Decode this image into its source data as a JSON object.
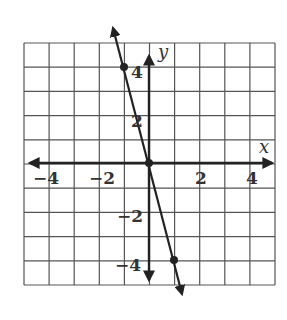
{
  "chart_data": {
    "type": "line",
    "title": "",
    "xlabel": "x",
    "ylabel": "y",
    "xlim": [
      -5,
      5
    ],
    "ylim": [
      -5,
      5
    ],
    "grid": true,
    "x_ticks": [
      "-4",
      "-2",
      "2",
      "4"
    ],
    "y_ticks": [
      "4",
      "2",
      "-2",
      "-4"
    ],
    "series": [
      {
        "name": "line",
        "equation": "y = -4x",
        "points": [
          [
            -1,
            4
          ],
          [
            0,
            0
          ],
          [
            1,
            -4
          ]
        ]
      }
    ],
    "colors": {
      "grid": "#555555",
      "axis": "#222222",
      "line": "#222222"
    }
  },
  "labels": {
    "x_axis": "x",
    "y_axis": "y",
    "x_tick_neg4": "−4",
    "x_tick_neg2": "−2",
    "x_tick_2": "2",
    "x_tick_4": "4",
    "y_tick_4": "4",
    "y_tick_2": "2",
    "y_tick_neg2": "−2",
    "y_tick_neg4": "−4"
  }
}
